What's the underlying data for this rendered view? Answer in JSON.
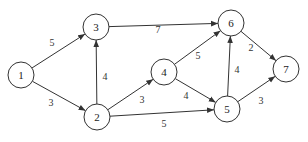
{
  "graph": {
    "directed": true,
    "nodes": [
      {
        "id": "1",
        "label": "1",
        "x": 21,
        "y": 75
      },
      {
        "id": "2",
        "label": "2",
        "x": 97,
        "y": 117
      },
      {
        "id": "3",
        "label": "3",
        "x": 96,
        "y": 27
      },
      {
        "id": "4",
        "label": "4",
        "x": 164,
        "y": 72
      },
      {
        "id": "5",
        "label": "5",
        "x": 227,
        "y": 109
      },
      {
        "id": "6",
        "label": "6",
        "x": 231,
        "y": 23
      },
      {
        "id": "7",
        "label": "7",
        "x": 286,
        "y": 69
      }
    ],
    "edges": [
      {
        "from": "1",
        "to": "3",
        "weight": "5",
        "lx": 52,
        "ly": 46
      },
      {
        "from": "1",
        "to": "2",
        "weight": "3",
        "lx": 51,
        "ly": 106
      },
      {
        "from": "2",
        "to": "3",
        "weight": "4",
        "lx": 105,
        "ly": 80
      },
      {
        "from": "2",
        "to": "4",
        "weight": "3",
        "lx": 142,
        "ly": 103
      },
      {
        "from": "2",
        "to": "5",
        "weight": "5",
        "lx": 164,
        "ly": 127
      },
      {
        "from": "3",
        "to": "6",
        "weight": "7",
        "lx": 158,
        "ly": 33
      },
      {
        "from": "4",
        "to": "6",
        "weight": "5",
        "lx": 198,
        "ly": 59
      },
      {
        "from": "4",
        "to": "5",
        "weight": "4",
        "lx": 186,
        "ly": 99
      },
      {
        "from": "5",
        "to": "6",
        "weight": "4",
        "lx": 237,
        "ly": 73
      },
      {
        "from": "6",
        "to": "7",
        "weight": "2",
        "lx": 251,
        "ly": 51
      },
      {
        "from": "5",
        "to": "7",
        "weight": "3",
        "lx": 261,
        "ly": 104
      }
    ]
  }
}
